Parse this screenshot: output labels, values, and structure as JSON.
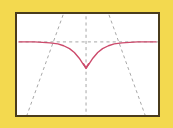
{
  "background": {
    "color": "#f3d94f",
    "name": "yellow-page-background"
  },
  "frame": {
    "border_color": "#4a3c1c",
    "fill_color": "#ffffff",
    "x": 15,
    "y": 12,
    "width": 145,
    "height": 105
  },
  "chart_data": {
    "type": "line",
    "title": "",
    "subtitle": "",
    "xlabel": "",
    "ylabel": "",
    "grid": false,
    "legend": "none",
    "axis_ticks": [],
    "tick_labels": [],
    "annotations": [],
    "xlim": [
      -3.14159,
      3.14159
    ],
    "ylim": [
      -1.2,
      1.2
    ],
    "series": [
      {
        "name": "cusped-cosine-curve",
        "color": "#cc4a6b",
        "linestyle": "solid",
        "linewidth": 1.4,
        "description": "Smooth arch rising toward both sides with a sharp V cusp at the centre",
        "points_px": [
          [
            17,
            41
          ],
          [
            25,
            41
          ],
          [
            33,
            41
          ],
          [
            41,
            41.5
          ],
          [
            49,
            42
          ],
          [
            57,
            43
          ],
          [
            63,
            45
          ],
          [
            69,
            48
          ],
          [
            74,
            52
          ],
          [
            79,
            58
          ],
          [
            83,
            64
          ],
          [
            86,
            68
          ],
          [
            89,
            64
          ],
          [
            93,
            58
          ],
          [
            98,
            52
          ],
          [
            103,
            48
          ],
          [
            109,
            45
          ],
          [
            115,
            43
          ],
          [
            123,
            42
          ],
          [
            131,
            41.5
          ],
          [
            139,
            41
          ],
          [
            147,
            41
          ],
          [
            155,
            41
          ],
          [
            158,
            41
          ]
        ]
      }
    ],
    "guides": [
      {
        "name": "horizontal-asymptote",
        "orientation": "horizontal",
        "color": "#9b9b9b",
        "linestyle": "dashed",
        "y_px": 41,
        "x1_px": 17,
        "x2_px": 158
      },
      {
        "name": "vertical-center-axis",
        "orientation": "vertical",
        "color": "#9b9b9b",
        "linestyle": "dashed",
        "x_px": 86,
        "y1_px": 14,
        "y2_px": 115
      },
      {
        "name": "diagonal-asymptote-left",
        "orientation": "diagonal",
        "color": "#9b9b9b",
        "linestyle": "dashed",
        "x1_px": 62,
        "y1_px": 14,
        "x2_px": 26,
        "y2_px": 115
      },
      {
        "name": "diagonal-asymptote-right",
        "orientation": "diagonal",
        "color": "#9b9b9b",
        "linestyle": "dashed",
        "x1_px": 110,
        "y1_px": 14,
        "x2_px": 146,
        "y2_px": 115
      }
    ],
    "intersections_px": [
      [
        57,
        43
      ],
      [
        115,
        43
      ],
      [
        86,
        68
      ]
    ]
  }
}
